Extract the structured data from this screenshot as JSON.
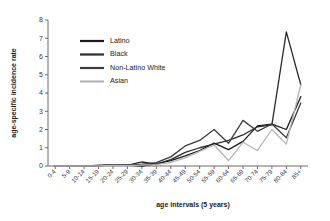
{
  "chart_data": {
    "type": "line",
    "title": "",
    "xlabel": "age intervals (5 years)",
    "ylabel": "age-specific incidence rate",
    "ylim": [
      0,
      8
    ],
    "yticks": [
      0,
      1,
      2,
      3,
      4,
      5,
      6,
      7,
      8
    ],
    "grid": false,
    "legend_position": "upper-left-inside",
    "categories": [
      "0-4",
      "5-9",
      "10-14",
      "15-19",
      "20-24",
      "25-29",
      "30-34",
      "35-39",
      "40-44",
      "45-49",
      "50-54",
      "55-59",
      "60-64",
      "65-69",
      "70-74",
      "75-79",
      "80-84",
      "85+"
    ],
    "series": [
      {
        "name": "Latino",
        "color": "#1a1a1a",
        "values": [
          0.0,
          0.0,
          0.0,
          0.02,
          0.05,
          0.05,
          0.0,
          0.12,
          0.3,
          0.55,
          0.85,
          1.25,
          0.9,
          1.35,
          2.2,
          2.3,
          2.0,
          3.8
        ]
      },
      {
        "name": "Black",
        "color": "#2b2b2b",
        "values": [
          0.0,
          0.0,
          0.0,
          0.03,
          0.06,
          0.03,
          0.22,
          0.1,
          0.35,
          0.75,
          1.0,
          1.2,
          1.4,
          1.7,
          2.15,
          2.25,
          7.35,
          4.45
        ]
      },
      {
        "name": "Non-Latino White",
        "color": "#3d3d3d",
        "values": [
          0.0,
          0.0,
          0.01,
          0.03,
          0.05,
          0.04,
          0.1,
          0.18,
          0.5,
          1.1,
          1.4,
          2.0,
          1.25,
          2.5,
          1.9,
          2.3,
          1.55,
          3.45
        ]
      },
      {
        "name": "Asian",
        "color": "#b5b5b5",
        "values": [
          0.0,
          0.0,
          0.0,
          0.01,
          0.03,
          0.02,
          0.05,
          0.08,
          0.2,
          0.45,
          0.8,
          1.15,
          0.3,
          1.3,
          0.85,
          2.0,
          1.2,
          4.45
        ]
      }
    ]
  },
  "legend": {
    "items": [
      {
        "label": "Latino"
      },
      {
        "label": "Black"
      },
      {
        "label": "Non-Latino White"
      },
      {
        "label": "Asian"
      }
    ]
  }
}
